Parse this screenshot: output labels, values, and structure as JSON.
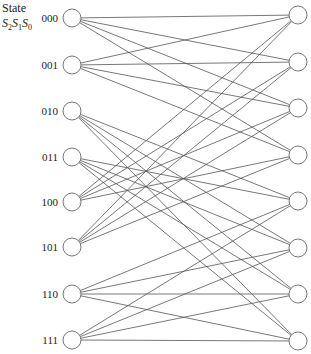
{
  "header": {
    "title": "State",
    "subtitle": [
      "S",
      "2",
      "S",
      "1",
      "S",
      "0"
    ]
  },
  "diagram": {
    "type": "trellis",
    "states": [
      "000",
      "001",
      "010",
      "011",
      "100",
      "101",
      "110",
      "111"
    ],
    "left_x": 72,
    "right_x": 298,
    "node_radius": 9,
    "left_y": [
      18,
      65,
      111,
      157,
      202,
      247,
      294,
      340
    ],
    "right_y": [
      15,
      62,
      108,
      155,
      201,
      248,
      294,
      341
    ],
    "edge_color": "#555555",
    "node_stroke": "#666666",
    "transitions": {
      "000": [
        "000",
        "001",
        "010",
        "011"
      ],
      "001": [
        "000",
        "001",
        "010",
        "011"
      ],
      "010": [
        "100",
        "101",
        "110",
        "111"
      ],
      "011": [
        "100",
        "101",
        "110",
        "111"
      ],
      "100": [
        "000",
        "001",
        "010",
        "011"
      ],
      "101": [
        "000",
        "001",
        "010",
        "011"
      ],
      "110": [
        "100",
        "101",
        "110",
        "111"
      ],
      "111": [
        "100",
        "101",
        "110",
        "111"
      ]
    }
  }
}
